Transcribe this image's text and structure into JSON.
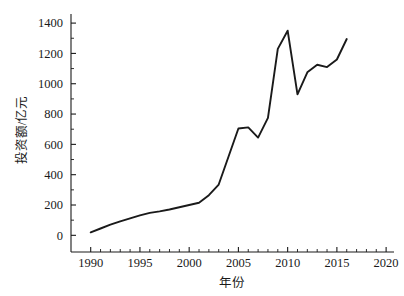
{
  "chart_data": {
    "type": "line",
    "title": "",
    "xlabel": "年份",
    "ylabel": "投资额/亿元",
    "xlim": [
      1988,
      2020.8
    ],
    "ylim": [
      -110,
      1460
    ],
    "grid": false,
    "legend": null,
    "x_ticks": [
      1990,
      1995,
      2000,
      2005,
      2010,
      2015,
      2020
    ],
    "x_tick_labels": [
      "1990",
      "1995",
      "2000",
      "2005",
      "2010",
      "2015",
      "2020"
    ],
    "x_minor_ticks": [
      1991,
      1992,
      1993,
      1994,
      1996,
      1997,
      1998,
      1999,
      2001,
      2002,
      2003,
      2004,
      2006,
      2007,
      2008,
      2009,
      2011,
      2012,
      2013,
      2014,
      2016,
      2017,
      2018,
      2019
    ],
    "y_ticks": [
      0,
      200,
      400,
      600,
      800,
      1000,
      1200,
      1400
    ],
    "y_tick_labels": [
      "0",
      "200",
      "400",
      "600",
      "800",
      "1000",
      "1200",
      "1400"
    ],
    "y_minor_ticks": [
      100,
      300,
      500,
      700,
      900,
      1100,
      1300
    ],
    "series": [
      {
        "name": "投资额",
        "color": "#1a1a1a",
        "x": [
          1990,
          1991,
          1992,
          1993,
          1994,
          1995,
          1996,
          1997,
          1998,
          1999,
          2000,
          2001,
          2002,
          2003,
          2004,
          2005,
          2006,
          2007,
          2008,
          2009,
          2010,
          2011,
          2012,
          2013,
          2014,
          2015,
          2016
        ],
        "values": [
          20,
          45,
          70,
          92,
          112,
          132,
          148,
          158,
          170,
          185,
          200,
          215,
          265,
          335,
          520,
          705,
          712,
          645,
          775,
          1230,
          1350,
          930,
          1075,
          1125,
          1110,
          1160,
          1295
        ]
      }
    ]
  },
  "axis_labels": {
    "x_title": "年份",
    "y_title": "投资额/亿元"
  }
}
